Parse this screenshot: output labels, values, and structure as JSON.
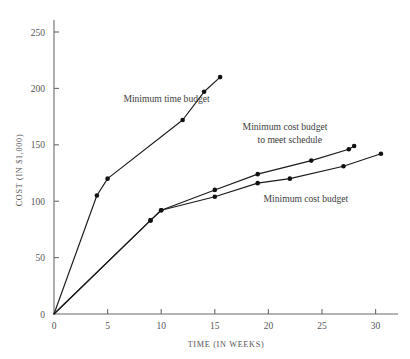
{
  "chart_data": {
    "type": "line",
    "title": "",
    "subtitle": "",
    "xlabel": "TIME (IN WEEKS)",
    "ylabel": "COST (IN $1,000)",
    "xlim": [
      0,
      32
    ],
    "ylim": [
      0,
      265
    ],
    "grid": false,
    "legend_position": "inline-annotations",
    "xticks": [
      0,
      5,
      10,
      15,
      20,
      25,
      30
    ],
    "xtick_labels": [
      "0",
      "5",
      "10",
      "15",
      "20",
      "25",
      "30"
    ],
    "yticks": [
      0,
      50,
      100,
      150,
      200,
      250
    ],
    "ytick_labels": [
      "0",
      "50",
      "100",
      "150",
      "200",
      "250"
    ],
    "series": [
      {
        "name": "Minimum time budget",
        "label": "Minimum time budget",
        "x": [
          0,
          4,
          5,
          12,
          14,
          15.5
        ],
        "values": [
          0,
          105,
          120,
          172,
          197,
          210
        ],
        "marker": "filled-circle"
      },
      {
        "name": "Minimum cost budget to meet schedule",
        "label": "Minimum cost budget\nto meet schedule",
        "label_line_1": "Minimum cost budget",
        "label_line_2": "to meet schedule",
        "x": [
          0,
          9,
          10,
          15,
          19,
          24,
          27.5,
          28
        ],
        "values": [
          0,
          83,
          92,
          110,
          124,
          136,
          146,
          149
        ],
        "marker": "filled-circle"
      },
      {
        "name": "Minimum cost budget",
        "label": "Minimum cost budget",
        "x": [
          0,
          9,
          10,
          15,
          19,
          22,
          27,
          30.5
        ],
        "values": [
          0,
          83,
          92,
          104,
          116,
          120,
          131,
          142
        ],
        "marker": "filled-circle"
      }
    ],
    "annotations": [
      {
        "text": "Minimum time budget",
        "x": 10.5,
        "y": 188
      },
      {
        "text": "Minimum cost budget",
        "x": 25.5,
        "y": 163
      },
      {
        "text": "to meet schedule",
        "x": 25.0,
        "y": 152
      },
      {
        "text": "Minimum cost budget",
        "x": 23.5,
        "y": 99
      }
    ],
    "colors": {
      "background": "#ffffff",
      "line": "#1a1a1a",
      "marker": "#111111",
      "axis": "#6b6b6b",
      "tick_text": "#555555",
      "annotation_text": "#3d3d3d"
    }
  }
}
